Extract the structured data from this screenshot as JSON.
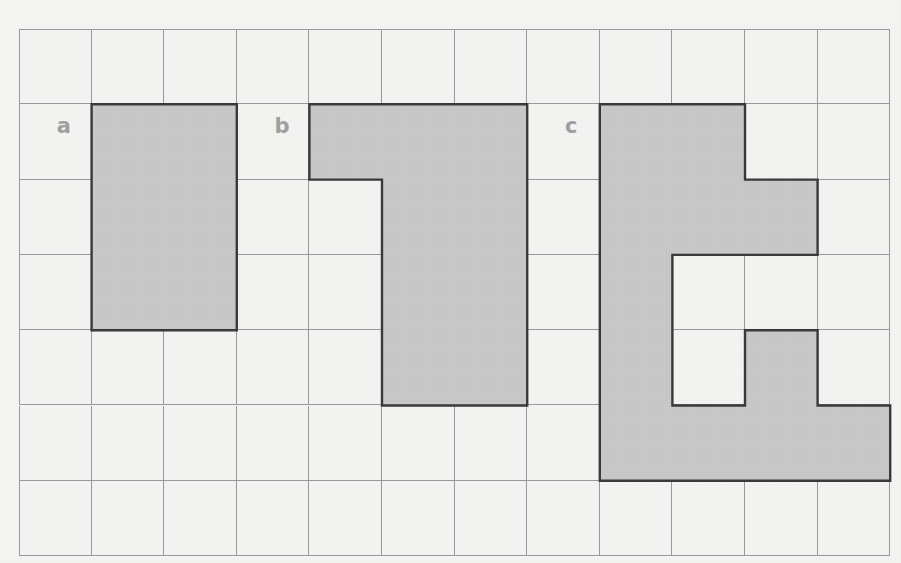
{
  "canvas": {
    "width": 901,
    "height": 563,
    "background": "#f4f4f2"
  },
  "grid": {
    "origin_x": 19,
    "origin_y": 29,
    "cols": 12,
    "rows": 7,
    "cell_width": 72.6,
    "cell_height": 75.3,
    "line_color": "#9a9a9a",
    "cell_fill": "#f3f3f1"
  },
  "style": {
    "shape_fill": "#c8c8c8",
    "shape_outline": "#3a3a3a",
    "label_color": "#a0a0a0"
  },
  "chart_data": {
    "type": "table",
    "title": "",
    "grid_cols": 12,
    "grid_rows": 7,
    "shapes": [
      {
        "label": "a",
        "cell_count": 6,
        "description": "2 by 3 rectangle",
        "cells": [
          [
            1,
            1
          ],
          [
            2,
            1
          ],
          [
            1,
            2
          ],
          [
            2,
            2
          ],
          [
            1,
            3
          ],
          [
            2,
            3
          ]
        ],
        "label_cell": [
          0,
          1
        ]
      },
      {
        "label": "b",
        "cell_count": 9,
        "description": "top row of three squares with the right two columns extending down three more rows",
        "cells": [
          [
            4,
            1
          ],
          [
            5,
            1
          ],
          [
            6,
            1
          ],
          [
            5,
            2
          ],
          [
            6,
            2
          ],
          [
            5,
            3
          ],
          [
            6,
            3
          ],
          [
            5,
            4
          ],
          [
            6,
            4
          ]
        ],
        "label_cell": [
          3,
          1
        ]
      },
      {
        "label": "c",
        "cell_count": 12,
        "description": "irregular shape with an interior notch",
        "cells": [
          [
            8,
            1
          ],
          [
            9,
            1
          ],
          [
            8,
            2
          ],
          [
            9,
            2
          ],
          [
            10,
            2
          ],
          [
            8,
            3
          ],
          [
            8,
            4
          ],
          [
            10,
            4
          ],
          [
            8,
            5
          ],
          [
            9,
            5
          ],
          [
            10,
            5
          ],
          [
            11,
            5
          ]
        ],
        "label_cell": [
          7,
          1
        ]
      }
    ]
  },
  "labels": [
    {
      "text": "a",
      "name": "shape-label-a"
    },
    {
      "text": "b",
      "name": "shape-label-b"
    },
    {
      "text": "c",
      "name": "shape-label-c"
    }
  ]
}
